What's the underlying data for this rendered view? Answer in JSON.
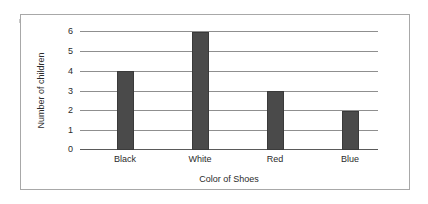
{
  "chart_data": {
    "type": "bar",
    "title": "",
    "subtitle": "",
    "categories": [
      "Black",
      "White",
      "Red",
      "Blue"
    ],
    "values": [
      4,
      6,
      3,
      2
    ],
    "series": [
      {
        "name": "Number of children",
        "values": [
          4,
          6,
          3,
          2
        ]
      }
    ],
    "xlabel": "Color of Shoes",
    "ylabel": "Number of children",
    "ylim": [
      0,
      6
    ],
    "yticks": [
      "0",
      "1",
      "2",
      "3",
      "4",
      "5",
      "6"
    ],
    "ytick_values": [
      0,
      1,
      2,
      3,
      4,
      5,
      6
    ],
    "grid": true,
    "grid_axis": "y",
    "legend": false,
    "legend_position": "none",
    "annotations": [],
    "colors": {
      "bar_fill": "#4a4a4a",
      "bar_outline": "#3a3a3a",
      "gridline": "#8f8f8f",
      "axis": "#5a5a5a",
      "frame": "#a8a8a8",
      "text": "#2b2b2b",
      "background": "#ffffff"
    }
  }
}
